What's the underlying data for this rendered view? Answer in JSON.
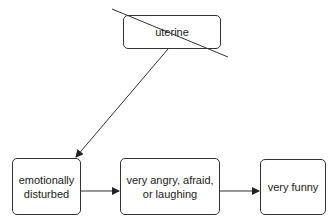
{
  "diagram": {
    "nodes": [
      {
        "id": "uterine",
        "label": "uterine",
        "crossed_out": true
      },
      {
        "id": "emotionally-disturbed",
        "label": "emotionally disturbed"
      },
      {
        "id": "very-angry",
        "label": "very angry, afraid, or laughing"
      },
      {
        "id": "very-funny",
        "label": "very funny"
      }
    ],
    "edges": [
      {
        "from": "uterine",
        "to": "emotionally-disturbed"
      },
      {
        "from": "emotionally-disturbed",
        "to": "very-angry"
      },
      {
        "from": "very-angry",
        "to": "very-funny"
      }
    ],
    "colors": {
      "stroke": "#333333",
      "background": "#ffffff"
    }
  }
}
